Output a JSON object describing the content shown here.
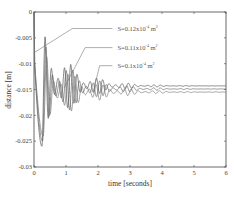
{
  "chart_data": {
    "type": "line",
    "title": "",
    "xlabel": "time [seconds]",
    "ylabel": "distance [m]",
    "xlim": [
      0,
      6
    ],
    "ylim": [
      -0.03,
      0
    ],
    "xticks": [
      0,
      1,
      2,
      3,
      4,
      5,
      6
    ],
    "xtick_labels": [
      "0",
      "1",
      "2",
      "3",
      "4",
      "5",
      "6"
    ],
    "yticks": [
      0,
      -0.005,
      -0.01,
      -0.015,
      -0.02,
      -0.025,
      -0.03
    ],
    "ytick_labels": [
      "0",
      "-0.005",
      "-0.01",
      "-0.015",
      "-0.02",
      "-0.025",
      "-0.03"
    ],
    "grid": false,
    "legend_position": "annotations with leader lines, upper right",
    "series": [
      {
        "name": "S=0.12x10⁻⁴ m²",
        "label_main": "S=0.12x10",
        "label_exp": "-4",
        "label_unit": " m",
        "label_unit_exp": "2",
        "steady_value": -0.0143,
        "min_value": -0.026,
        "min_time": 0.25,
        "decay": 1.15,
        "period": 0.2,
        "color": "#555555",
        "points": [
          [
            0,
            0
          ],
          [
            0.05,
            -0.008
          ],
          [
            0.25,
            -0.026
          ],
          [
            0.5,
            -0.012
          ],
          [
            0.8,
            -0.009
          ],
          [
            1.0,
            -0.019
          ],
          [
            1.5,
            -0.012
          ],
          [
            2.0,
            -0.0165
          ],
          [
            3.0,
            -0.0145
          ],
          [
            4.0,
            -0.0143
          ],
          [
            6.0,
            -0.0143
          ]
        ]
      },
      {
        "name": "S=0.11x10⁻⁴ m²",
        "label_main": "S=0.11x10",
        "label_exp": "-4",
        "label_unit": " m",
        "label_unit_exp": "2",
        "steady_value": -0.0149,
        "min_value": -0.025,
        "min_time": 0.27,
        "decay": 1.05,
        "period": 0.21,
        "color": "#666666",
        "points": [
          [
            0,
            0
          ],
          [
            0.27,
            -0.025
          ],
          [
            0.8,
            -0.0095
          ],
          [
            1.5,
            -0.0125
          ],
          [
            2.0,
            -0.017
          ],
          [
            3.0,
            -0.0152
          ],
          [
            4.0,
            -0.0149
          ],
          [
            6.0,
            -0.0149
          ]
        ]
      },
      {
        "name": "S=0.1x10⁻⁴ m²",
        "label_main": "S=0.1x10",
        "label_exp": "-4",
        "label_unit": " m",
        "label_unit_exp": "2",
        "steady_value": -0.0155,
        "min_value": -0.024,
        "min_time": 0.29,
        "decay": 0.95,
        "period": 0.22,
        "color": "#777777",
        "points": [
          [
            0,
            0
          ],
          [
            0.29,
            -0.024
          ],
          [
            0.8,
            -0.01
          ],
          [
            1.5,
            -0.013
          ],
          [
            2.0,
            -0.0175
          ],
          [
            3.0,
            -0.0158
          ],
          [
            4.0,
            -0.0155
          ],
          [
            6.0,
            -0.0155
          ]
        ]
      }
    ],
    "annotations": [
      {
        "series": 0,
        "anchor": [
          0.02,
          -0.0078
        ],
        "elbow": [
          1.2,
          -0.0032
        ],
        "end": [
          2.45,
          -0.0032
        ]
      },
      {
        "series": 1,
        "anchor": [
          0.95,
          -0.0146
        ],
        "elbow": [
          1.6,
          -0.0069
        ],
        "end": [
          2.45,
          -0.0069
        ]
      },
      {
        "series": 2,
        "anchor": [
          1.85,
          -0.0155
        ],
        "elbow": [
          2.05,
          -0.0104
        ],
        "end": [
          2.45,
          -0.0104
        ]
      }
    ]
  }
}
